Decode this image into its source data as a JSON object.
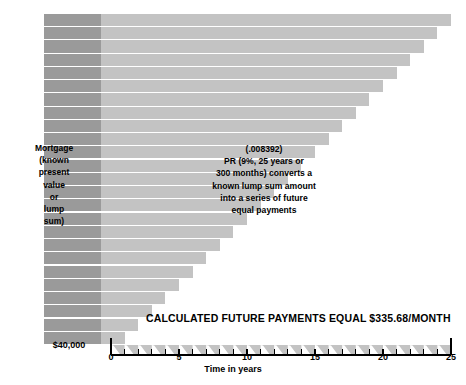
{
  "figure": {
    "labels": {
      "mortgage": "Mortgage\n(known\npresent\nvalue\nor\nlump\nsum)",
      "pr_block": "(.008392)\nPR (9%, 25 years or\n300 months) converts a\nknown lump sum amount\ninto a series of future\nequal payments",
      "principal_amount": "$40,000",
      "banner": "CALCULATED FUTURE PAYMENTS EQUAL $335.68/MONTH",
      "axis_title": "Time in years"
    }
  },
  "chart_data": {
    "type": "bar",
    "title": "",
    "subtitle": "",
    "xlabel": "Time in years",
    "ylabel": "",
    "xlim": [
      0,
      25
    ],
    "ylim": [
      0,
      25
    ],
    "grid": false,
    "legend": null,
    "x_ticks": [
      "0",
      "5",
      "10",
      "15",
      "20",
      "25"
    ],
    "x_tick_values": [
      0,
      5,
      10,
      15,
      20,
      25
    ],
    "orientation": "horizontal",
    "categories": [
      "1",
      "2",
      "3",
      "4",
      "5",
      "6",
      "7",
      "8",
      "9",
      "10",
      "11",
      "12",
      "13",
      "14",
      "15",
      "16",
      "17",
      "18",
      "19",
      "20",
      "21",
      "22",
      "23",
      "24",
      "25"
    ],
    "values": [
      25,
      24,
      23,
      22,
      21,
      20,
      19,
      18,
      17,
      16,
      15,
      14,
      13,
      12,
      11,
      10,
      9,
      8,
      7,
      6,
      5,
      4,
      3,
      2,
      1
    ],
    "series": [
      {
        "name": "Remaining payment stream (years)",
        "values": [
          25,
          24,
          23,
          22,
          21,
          20,
          19,
          18,
          17,
          16,
          15,
          14,
          13,
          12,
          11,
          10,
          9,
          8,
          7,
          6,
          5,
          4,
          3,
          2,
          1
        ]
      }
    ],
    "annotations": [
      {
        "text": "(.008392)",
        "role": "pr-factor"
      },
      {
        "text": "PR (9%, 25 years or 300 months) converts a known lump sum amount into a series of future equal payments",
        "role": "pr-description"
      },
      {
        "text": "CALCULATED FUTURE PAYMENTS EQUAL $335.68/MONTH",
        "role": "result-banner"
      },
      {
        "text": "Mortgage (known present value or lump sum)",
        "role": "principal-block"
      },
      {
        "text": "$40,000",
        "role": "principal-amount"
      }
    ],
    "parameters": {
      "interest_rate": "9%",
      "term_years": 25,
      "term_months": 300,
      "pr_factor": 0.008392,
      "present_value": 40000,
      "monthly_payment": 335.68
    }
  },
  "colors": {
    "background": "#ffffff",
    "principal_block": "#9a9a9a",
    "payment_block": "#c3c3c3",
    "separator": "#ffffff",
    "axis": "#000000",
    "text": "#000000"
  },
  "ticks": [
    {
      "label": "0",
      "value": 0
    },
    {
      "label": "5",
      "value": 5
    },
    {
      "label": "10",
      "value": 10
    },
    {
      "label": "15",
      "value": 15
    },
    {
      "label": "20",
      "value": 20
    },
    {
      "label": "25",
      "value": 25
    }
  ]
}
